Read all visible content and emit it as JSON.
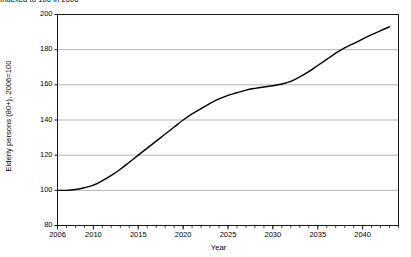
{
  "caption": {
    "top_note": "Indexed to 100 in 2006"
  },
  "chart_data": {
    "type": "line",
    "title": "",
    "subtitle": "Indexed to 100 in 2006",
    "xlabel": "Year",
    "ylabel": "Elderly persons (80+), 2006=100",
    "xlim": [
      2006,
      2044
    ],
    "ylim": [
      80,
      200
    ],
    "yticks": [
      80,
      100,
      120,
      140,
      160,
      180,
      200
    ],
    "ytick_labels": [
      "80",
      "100",
      "120",
      "140",
      "160",
      "180",
      "200"
    ],
    "xticks": [
      2006,
      2010,
      2015,
      2020,
      2025,
      2030,
      2035,
      2040
    ],
    "xtick_labels": [
      "2006",
      "2010",
      "2015",
      "2020",
      "2025",
      "2030",
      "2035",
      "2040"
    ],
    "minor_xticks_interval": 1,
    "grid": "horizontal",
    "grid_color": "#b4b4b4",
    "legend": "none",
    "line_color": "#000000",
    "line_width": 1.4,
    "series": [
      {
        "name": "Elderly persons (80+), 2006=100",
        "x": [
          2006,
          2007,
          2008,
          2009,
          2010,
          2011,
          2012,
          2013,
          2014,
          2015,
          2016,
          2017,
          2018,
          2019,
          2020,
          2021,
          2022,
          2023,
          2024,
          2025,
          2026,
          2027,
          2028,
          2029,
          2030,
          2031,
          2032,
          2033,
          2034,
          2035,
          2036,
          2037,
          2038,
          2039,
          2040,
          2041,
          2042,
          2043
        ],
        "values": [
          100,
          100,
          100.5,
          101.5,
          103,
          105.5,
          108.5,
          112,
          116,
          120,
          124,
          128,
          132,
          136,
          140,
          143.5,
          146.5,
          149.5,
          152,
          154,
          155.5,
          157,
          158,
          158.8,
          159.5,
          160.5,
          162,
          164.5,
          167.5,
          171,
          174.5,
          178,
          181,
          183.5,
          186,
          188.5,
          190.8,
          193
        ]
      }
    ]
  }
}
